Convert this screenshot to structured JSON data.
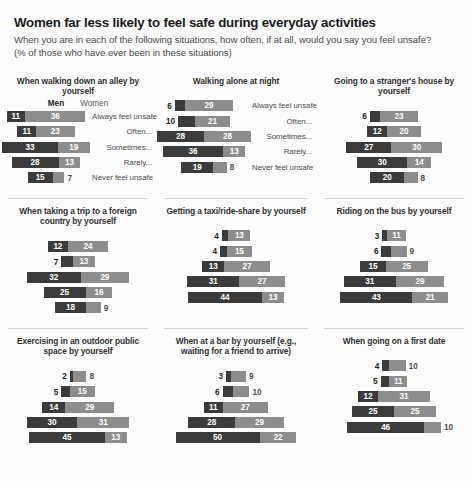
{
  "title": "Women far less likely to feel safe during everyday activities",
  "subtitle": "When you are in each of the following situations, how often, if at all, would you say you feel unsafe? (% of those who have ever been in these situations)",
  "legend": {
    "men": "Men",
    "women": "Women"
  },
  "categories": [
    "Always feel unsafe",
    "Often...",
    "Sometimes...",
    "Rarely...",
    "Never feel unsafe"
  ],
  "colors": {
    "men": "#3b3b3b",
    "women": "#8d8d8d",
    "rule": "#d2d2d2",
    "title": "#1b1b1b",
    "subtitle": "#4a4a4a"
  },
  "chart_data": {
    "type": "bar",
    "title": "Women far less likely to feel safe during everyday activities",
    "subtitle": "When you are in each of the following situations, how often, if at all, would you say you feel unsafe? (% of those who have ever been in these situations)",
    "xlabel": "",
    "ylabel": "",
    "unit": "percent",
    "orientation": "horizontal",
    "stacked": true,
    "centered": true,
    "grid": false,
    "legend_position": "top-left-panel",
    "categories": [
      "Always feel unsafe",
      "Often...",
      "Sometimes...",
      "Rarely...",
      "Never feel unsafe"
    ],
    "series_names": [
      "Men",
      "Women"
    ],
    "panels": [
      {
        "title": "When walking down an alley by yourself",
        "rows": [
          {
            "category": "Always feel unsafe",
            "men": 11,
            "women": 36
          },
          {
            "category": "Often...",
            "men": 11,
            "women": 23
          },
          {
            "category": "Sometimes...",
            "men": 33,
            "women": 19
          },
          {
            "category": "Rarely...",
            "men": 28,
            "women": 13
          },
          {
            "category": "Never feel unsafe",
            "men": 15,
            "women": 7
          }
        ]
      },
      {
        "title": "Walking alone at night",
        "rows": [
          {
            "category": "Always feel unsafe",
            "men": 6,
            "women": 29
          },
          {
            "category": "Often...",
            "men": 10,
            "women": 21
          },
          {
            "category": "Sometimes...",
            "men": 28,
            "women": 28
          },
          {
            "category": "Rarely...",
            "men": 36,
            "women": 13
          },
          {
            "category": "Never feel unsafe",
            "men": 19,
            "women": 8
          }
        ]
      },
      {
        "title": "Going to a stranger's house by yourself",
        "rows": [
          {
            "category": "Always feel unsafe",
            "men": 6,
            "women": 23
          },
          {
            "category": "Often...",
            "men": 12,
            "women": 20
          },
          {
            "category": "Sometimes...",
            "men": 27,
            "women": 30
          },
          {
            "category": "Rarely...",
            "men": 30,
            "women": 14
          },
          {
            "category": "Never feel unsafe",
            "men": 20,
            "women": 8
          }
        ]
      },
      {
        "title": "When taking a trip to a foreign country by yourself",
        "rows": [
          {
            "category": "Always feel unsafe",
            "men": 12,
            "women": 24
          },
          {
            "category": "Often...",
            "men": 7,
            "women": 13
          },
          {
            "category": "Sometimes...",
            "men": 32,
            "women": 29
          },
          {
            "category": "Rarely...",
            "men": 25,
            "women": 16
          },
          {
            "category": "Never feel unsafe",
            "men": 18,
            "women": 9
          }
        ]
      },
      {
        "title": "Getting a taxi/ride-share by yourself",
        "rows": [
          {
            "category": "Always feel unsafe",
            "men": 4,
            "women": 13
          },
          {
            "category": "Often...",
            "men": 4,
            "women": 15
          },
          {
            "category": "Sometimes...",
            "men": 13,
            "women": 27
          },
          {
            "category": "Rarely...",
            "men": 31,
            "women": 27
          },
          {
            "category": "Never feel unsafe",
            "men": 44,
            "women": 13
          }
        ]
      },
      {
        "title": "Riding on the bus by yourself",
        "rows": [
          {
            "category": "Always feel unsafe",
            "men": 3,
            "women": 11
          },
          {
            "category": "Often...",
            "men": 6,
            "women": 9
          },
          {
            "category": "Sometimes...",
            "men": 15,
            "women": 25
          },
          {
            "category": "Rarely...",
            "men": 31,
            "women": 29
          },
          {
            "category": "Never feel unsafe",
            "men": 43,
            "women": 21
          }
        ]
      },
      {
        "title": "Exercising in an outdoor public space by yourself",
        "rows": [
          {
            "category": "Always feel unsafe",
            "men": 2,
            "women": 8
          },
          {
            "category": "Often...",
            "men": 5,
            "women": 15
          },
          {
            "category": "Sometimes...",
            "men": 14,
            "women": 29
          },
          {
            "category": "Rarely...",
            "men": 30,
            "women": 31
          },
          {
            "category": "Never feel unsafe",
            "men": 45,
            "women": 13
          }
        ]
      },
      {
        "title": "When at a bar by yourself (e.g., waiting for a friend to arrive)",
        "rows": [
          {
            "category": "Always feel unsafe",
            "men": 3,
            "women": 9
          },
          {
            "category": "Often...",
            "men": 6,
            "women": 10
          },
          {
            "category": "Sometimes...",
            "men": 11,
            "women": 27
          },
          {
            "category": "Rarely...",
            "men": 28,
            "women": 29
          },
          {
            "category": "Never feel unsafe",
            "men": 50,
            "women": 22
          }
        ]
      },
      {
        "title": "When going on a first date",
        "rows": [
          {
            "category": "Always feel unsafe",
            "men": 4,
            "women": 10
          },
          {
            "category": "Often...",
            "men": 5,
            "women": 11
          },
          {
            "category": "Sometimes...",
            "men": 12,
            "women": 31
          },
          {
            "category": "Rarely...",
            "men": 25,
            "women": 25
          },
          {
            "category": "Never feel unsafe",
            "men": 46,
            "women": 10
          }
        ]
      }
    ]
  }
}
